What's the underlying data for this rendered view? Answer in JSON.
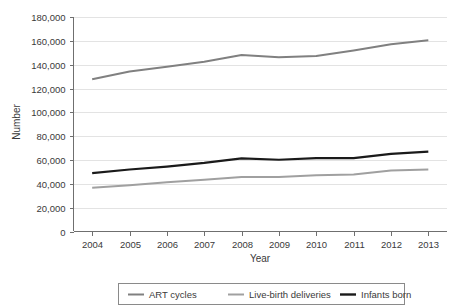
{
  "chart_data": {
    "type": "line",
    "title": "",
    "xlabel": "Year",
    "ylabel": "Number",
    "categories": [
      2004,
      2005,
      2006,
      2007,
      2008,
      2009,
      2010,
      2011,
      2012,
      2013
    ],
    "x_tick_labels": [
      "2004",
      "2005",
      "2006",
      "2007",
      "2008",
      "2009",
      "2010",
      "2011",
      "2012",
      "2013"
    ],
    "y_tick_labels": [
      "0",
      "20,000",
      "40,000",
      "60,000",
      "80,000",
      "100,000",
      "120,000",
      "140,000",
      "160,000",
      "180,000"
    ],
    "y_tick_values": [
      0,
      20000,
      40000,
      60000,
      80000,
      100000,
      120000,
      140000,
      160000,
      180000
    ],
    "ylim": [
      0,
      180000
    ],
    "grid": true,
    "legend_position": "bottom",
    "series": [
      {
        "name": "ART cycles",
        "color": "#808080",
        "width": 2.0,
        "values": [
          127800,
          134300,
          138200,
          142400,
          148100,
          146200,
          147300,
          151900,
          157200,
          160500
        ]
      },
      {
        "name": "Live-birth deliveries",
        "color": "#a0a0a0",
        "width": 2.0,
        "values": [
          36700,
          38900,
          41400,
          43400,
          45800,
          45700,
          47100,
          47800,
          51200,
          52000
        ]
      },
      {
        "name": "Infants born",
        "color": "#1a1a1a",
        "width": 2.2,
        "values": [
          49000,
          52000,
          54500,
          57600,
          61400,
          60200,
          61500,
          61600,
          65200,
          67000
        ]
      }
    ]
  },
  "legend": {
    "items": [
      {
        "label": "ART cycles",
        "color": "#808080"
      },
      {
        "label": "Live-birth deliveries",
        "color": "#a0a0a0"
      },
      {
        "label": "Infants born",
        "color": "#1a1a1a"
      }
    ]
  }
}
